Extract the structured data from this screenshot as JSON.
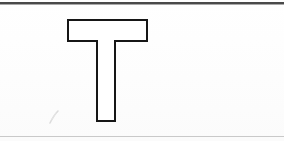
{
  "document": {
    "kind": "scanned-page-fragment",
    "background_color": "#fefefe",
    "width": 284,
    "height": 141,
    "caption": ""
  },
  "rules": {
    "top": {
      "name": "top-horizontal-rule",
      "color": "#4a4a4a",
      "y": 2,
      "thickness": 2
    },
    "top_shadow": {
      "name": "top-rule-shadow",
      "color": "#a9a9a9",
      "y": 4,
      "thickness": 1
    },
    "bottom": {
      "name": "bottom-horizontal-rule",
      "color": "#c9c9c9",
      "y": 136,
      "thickness": 1
    }
  },
  "glyph": {
    "character": "T",
    "style": "outline",
    "stroke_color": "#161616",
    "fill_color": "#ffffff",
    "stroke_width": 2,
    "bbox": {
      "x": 68,
      "y": 20,
      "width": 79,
      "height": 101
    },
    "bar": {
      "x": 68,
      "y": 20,
      "width": 79,
      "height": 21
    },
    "stem": {
      "x": 97,
      "y": 41,
      "width": 18,
      "height": 80
    },
    "outline_points": "68,20 147,20 147,41 115,41 115,121 97,121 97,41 68,41"
  },
  "annotations": [
    {
      "name": "pencil-stroke",
      "type": "freehand-mark",
      "color": "#dcdcdc",
      "from": {
        "x": 50,
        "y": 123
      },
      "to": {
        "x": 58,
        "y": 111
      }
    }
  ]
}
